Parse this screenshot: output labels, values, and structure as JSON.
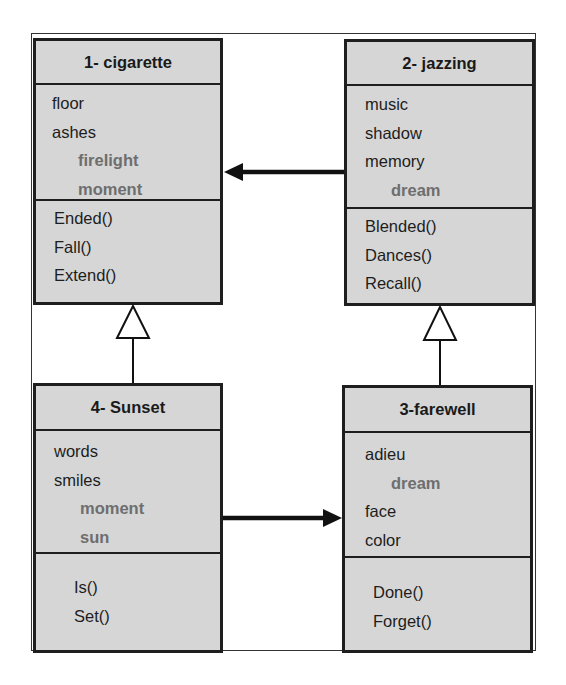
{
  "classes": {
    "cigarette": {
      "title": "1- cigarette",
      "attributes": [
        {
          "text": "floor",
          "sub": false
        },
        {
          "text": "ashes",
          "sub": false
        },
        {
          "text": "firelight",
          "sub": true
        },
        {
          "text": "moment",
          "sub": true
        }
      ],
      "methods": [
        "Ended()",
        "Fall()",
        "Extend()"
      ]
    },
    "jazzing": {
      "title": "2- jazzing",
      "attributes": [
        {
          "text": "music",
          "sub": false
        },
        {
          "text": "shadow",
          "sub": false
        },
        {
          "text": "memory",
          "sub": false
        },
        {
          "text": "dream",
          "sub": true
        }
      ],
      "methods": [
        "Blended()",
        "Dances()",
        "Recall()"
      ]
    },
    "farewell": {
      "title": "3-farewell",
      "attributes": [
        {
          "text": "adieu",
          "sub": false
        },
        {
          "text": "dream",
          "sub": true
        },
        {
          "text": "face",
          "sub": false
        },
        {
          "text": "color",
          "sub": false
        }
      ],
      "methods": [
        "Done()",
        "Forget()"
      ]
    },
    "sunset": {
      "title": "4- Sunset",
      "attributes": [
        {
          "text": "words",
          "sub": false
        },
        {
          "text": "smiles",
          "sub": false
        },
        {
          "text": "moment",
          "sub": true
        },
        {
          "text": "sun",
          "sub": true
        }
      ],
      "methods": [
        "Is()",
        "Set()"
      ]
    }
  },
  "relations": [
    {
      "type": "association",
      "from": "2- jazzing",
      "to": "1- cigarette"
    },
    {
      "type": "association",
      "from": "4- Sunset",
      "to": "3-farewell"
    },
    {
      "type": "generalization",
      "from": "4- Sunset",
      "to": "1- cigarette"
    },
    {
      "type": "generalization",
      "from": "3-farewell",
      "to": "2- jazzing"
    }
  ]
}
